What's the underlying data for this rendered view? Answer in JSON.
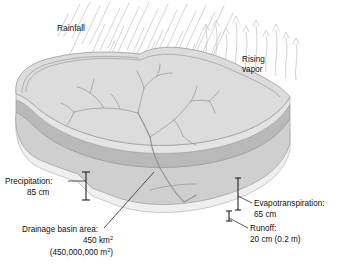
{
  "figure": {
    "kind": "water-balance-block-diagram"
  },
  "labels": {
    "rainfall": "Rainfall",
    "rising_vapor_line1": "Rising",
    "rising_vapor_line2": "vapor",
    "precipitation_line1": "Precipitation:",
    "precipitation_line2": "85 cm",
    "evapotranspiration_line1": "Evapotranspiration:",
    "evapotranspiration_line2": "65 cm",
    "runoff_line1": "Runoff:",
    "runoff_line2": "20 cm (0.2 m)",
    "basin_line1": "Drainage basin area:",
    "basin_line2_value": "450 km",
    "basin_line2_sup": "2",
    "basin_line3_open": "(450,000,000 m",
    "basin_line3_sup": "2",
    "basin_line3_close": ")"
  },
  "values": {
    "precipitation_cm": 85,
    "evapotranspiration_cm": 65,
    "runoff_cm": 20,
    "runoff_m": 0.2,
    "basin_area_km2": 450,
    "basin_area_m2": 450000000
  },
  "colors": {
    "page_background": "#ffffff",
    "top_surface": "#dcdcdc",
    "upper_rim": "#e4e4e4",
    "side_band_dark": "#b9b9b9",
    "front_face": "#cfcfcf",
    "base_layer": "#efefef",
    "outline": "#9b9b9b",
    "rain": "#c9cdd2",
    "vapor": "#c4c8cd",
    "river": "#9aa0a6",
    "text": "#111111"
  },
  "icons": {
    "rain": "rain-streaks-icon",
    "vapor": "upward-arrows-icon",
    "river": "dendritic-stream-network-icon",
    "bracket": "measurement-bracket-icon"
  }
}
